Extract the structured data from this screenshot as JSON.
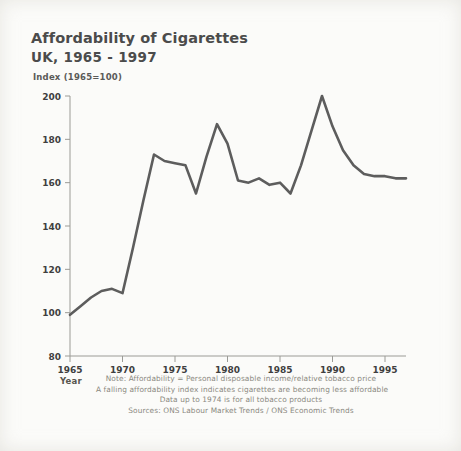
{
  "header": {
    "title": "Affordability of Cigarettes",
    "subtitle": "UK, 1965 - 1997"
  },
  "axis_unit_label": "Index (1965=100)",
  "year_axis_label": "Year",
  "footnotes": [
    "Note: Affordability = Personal disposable income/relative tobacco price",
    "A falling affordability index indicates cigarettes are becoming less affordable",
    "Data up to 1974 is for all tobacco products",
    "Sources: ONS Labour Market Trends / ONS Economic Trends"
  ],
  "colors": {
    "line": "#5d5d5d",
    "axis": "#9b9b96",
    "text": "#4b4b4b",
    "footnote": "#8a8880",
    "background": "#fbfbf9"
  },
  "chart_data": {
    "type": "line",
    "title": "Affordability of Cigarettes",
    "subtitle": "UK, 1965 - 1997",
    "xlabel": "Year",
    "ylabel": "Index (1965=100)",
    "xlim": [
      1965,
      1997
    ],
    "ylim": [
      80,
      200
    ],
    "xticks": [
      1965,
      1970,
      1975,
      1980,
      1985,
      1990,
      1995
    ],
    "yticks": [
      80,
      100,
      120,
      140,
      160,
      180,
      200
    ],
    "grid": false,
    "legend": "none",
    "series": [
      {
        "name": "Affordability index",
        "x": [
          1965,
          1966,
          1967,
          1968,
          1969,
          1970,
          1971,
          1972,
          1973,
          1974,
          1975,
          1976,
          1977,
          1978,
          1979,
          1980,
          1981,
          1982,
          1983,
          1984,
          1985,
          1986,
          1987,
          1988,
          1989,
          1990,
          1991,
          1992,
          1993,
          1994,
          1995,
          1996,
          1997
        ],
        "values": [
          99,
          103,
          107,
          110,
          111,
          109,
          130,
          152,
          173,
          170,
          169,
          168,
          155,
          172,
          187,
          178,
          161,
          160,
          162,
          159,
          160,
          155,
          168,
          184,
          200,
          186,
          175,
          168,
          164,
          163,
          163,
          162,
          162
        ]
      }
    ]
  }
}
